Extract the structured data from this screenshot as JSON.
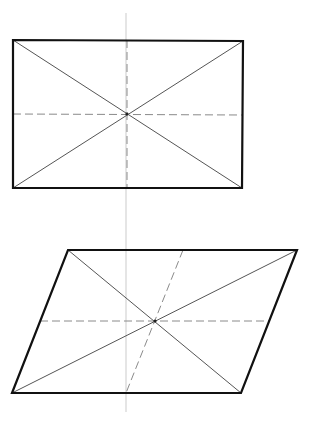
{
  "canvas": {
    "width": 314,
    "height": 424,
    "background": "#ffffff"
  },
  "colors": {
    "outline": "#111111",
    "diagonal": "#555555",
    "dashed": "#8a8a8a",
    "guide": "#dcdcdc"
  },
  "guide_line": {
    "x1": 126,
    "y1": 13,
    "x2": 126,
    "y2": 412
  },
  "rectangle": {
    "vertices": [
      [
        13,
        40
      ],
      [
        243,
        41
      ],
      [
        242,
        188
      ],
      [
        13,
        188
      ]
    ],
    "center": [
      127,
      114
    ],
    "diagonals": [
      [
        [
          13,
          40
        ],
        [
          242,
          188
        ]
      ],
      [
        [
          243,
          41
        ],
        [
          13,
          188
        ]
      ]
    ],
    "dashed_midlines": [
      [
        [
          13,
          114
        ],
        [
          242,
          115
        ]
      ],
      [
        [
          127,
          40
        ],
        [
          127,
          188
        ]
      ]
    ]
  },
  "parallelogram": {
    "vertices": [
      [
        68,
        250
      ],
      [
        297,
        250
      ],
      [
        241,
        393
      ],
      [
        12,
        393
      ]
    ],
    "center": [
      155,
      321
    ],
    "diagonals": [
      [
        [
          68,
          250
        ],
        [
          241,
          393
        ]
      ],
      [
        [
          297,
          250
        ],
        [
          12,
          393
        ]
      ]
    ],
    "dashed_midlines": [
      [
        [
          40,
          321
        ],
        [
          269,
          321
        ]
      ],
      [
        [
          183,
          250
        ],
        [
          126,
          393
        ]
      ]
    ]
  }
}
